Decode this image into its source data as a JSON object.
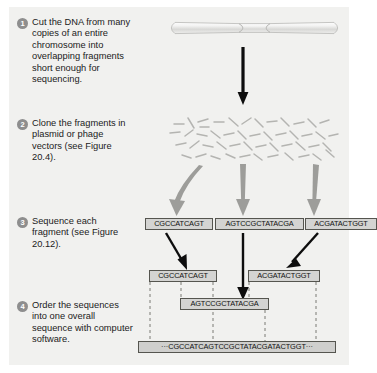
{
  "figure": {
    "background_color": "#f1f1ef",
    "accent_color": "#8e8e8e"
  },
  "steps": [
    {
      "number": "1",
      "text": "Cut the DNA from many copies of an entire chromosome into overlapping fragments short enough for sequencing."
    },
    {
      "number": "2",
      "text": "Clone the fragments in plasmid or phage vectors (see Figure 20.4)."
    },
    {
      "number": "3",
      "text": "Sequence each fragment (see Figure 20.12)."
    },
    {
      "number": "4",
      "text": "Order the sequences into one overall sequence with computer software."
    }
  ],
  "sequences": {
    "sequenced_fragments": [
      "CGCCATCAGT",
      "AGTCCGCTATACGA",
      "ACGATACTGGT"
    ],
    "ordered_fragments": [
      "CGCCATCAGT",
      "AGTCCGCTATACGA",
      "ACGATACTGGT"
    ],
    "assembled": "···CGCCATCAGTCCGCTATACGATACTGGT···"
  },
  "graphics": {
    "chromosome_label": "chromosome",
    "fragment_cloud_label": "cloned DNA fragments",
    "black_arrow_label": "sequencing arrow",
    "gray_arrow_label": "cloning arrow"
  }
}
